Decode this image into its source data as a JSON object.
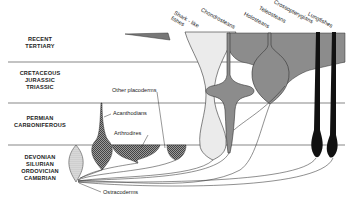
{
  "periods": [
    {
      "lines": [
        "RECENT",
        "TERTIARY"
      ]
    },
    {
      "lines": [
        "CRETACEOUS",
        "JURASSIC",
        "TRIASSIC"
      ]
    },
    {
      "lines": [
        "PERMIAN",
        "CARBONIFEROUS"
      ]
    },
    {
      "lines": [
        "DEVONIAN",
        "SILURIAN",
        "ORDOVICIAN",
        "CAMBRIAN"
      ]
    }
  ],
  "groups": {
    "shark_like": "Shark - like fishes",
    "chondrosteans": "Chondrosteans",
    "holosteans": "Holosteans",
    "teleosteans": "Teleosteans",
    "crossopterygians": "Crossopterygians",
    "lungfishes": "Lungfishes",
    "other_placoderms": "Other placoderms",
    "acanthodians": "Acanthodians",
    "arthrodires": "Arthrodires",
    "ostracoderms": "Ostracoderms"
  },
  "colors": {
    "gray": "#8c8c8c",
    "dark": "#111111",
    "light": "#e6e6e6",
    "line": "#333333"
  }
}
